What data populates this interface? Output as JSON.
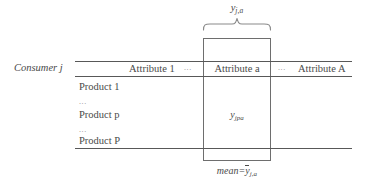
{
  "figure": {
    "type": "matrix-schematic",
    "top_annotation": {
      "base": "y",
      "subscript": "j,a"
    },
    "bottom_annotation": {
      "prefix": "mean=",
      "base": "y",
      "subscript": "j,a",
      "has_overbar": true
    },
    "stub_header": "Consumer j",
    "columns": [
      {
        "label": "Attribute 1",
        "kind": "attribute"
      },
      {
        "label": "...",
        "kind": "ellipsis"
      },
      {
        "label": "Attribute a",
        "kind": "attribute-highlighted"
      },
      {
        "label": "...",
        "kind": "ellipsis"
      },
      {
        "label": "Attribute A",
        "kind": "attribute"
      }
    ],
    "rows": [
      {
        "label": "Product 1",
        "kind": "row"
      },
      {
        "label": "...",
        "kind": "ellipsis"
      },
      {
        "label": "Product p",
        "kind": "row"
      },
      {
        "label": "...",
        "kind": "ellipsis"
      },
      {
        "label": "Product P",
        "kind": "row"
      }
    ],
    "cell_value": {
      "base": "y",
      "subscript": "jpa"
    },
    "colors": {
      "rule": "#585858",
      "box_border": "#6e6e6e",
      "text": "#4a4a4a",
      "ellipsis": "#8a8a8a",
      "background": "#ffffff"
    }
  }
}
